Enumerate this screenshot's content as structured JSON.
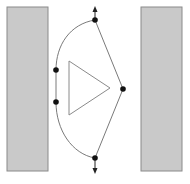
{
  "diagram": {
    "width": 190,
    "height": 184,
    "colors": {
      "background": "#ffffff",
      "wall_fill": "#c9c9c9",
      "wall_stroke": "#8a8a8a",
      "path_stroke": "#7a7a7a",
      "node_fill": "#111111",
      "triangle_stroke": "#8a8a8a"
    },
    "walls": [
      {
        "id": "left-wall",
        "x": 7,
        "y": 7,
        "w": 41,
        "h": 164
      },
      {
        "id": "right-wall",
        "x": 141,
        "y": 7,
        "w": 41,
        "h": 164
      }
    ],
    "nodes": [
      {
        "id": "top",
        "x": 95,
        "y": 20
      },
      {
        "id": "left-upper",
        "x": 56,
        "y": 70
      },
      {
        "id": "left-lower",
        "x": 56,
        "y": 102
      },
      {
        "id": "bottom",
        "x": 95,
        "y": 158
      },
      {
        "id": "right",
        "x": 123,
        "y": 89
      }
    ],
    "triangle": {
      "points": "69,61 110,88 69,115"
    },
    "arrows": [
      {
        "id": "up-arrow",
        "from": [
          95,
          20
        ],
        "to": [
          95,
          8
        ]
      },
      {
        "id": "down-arrow",
        "from": [
          95,
          158
        ],
        "to": [
          95,
          172
        ]
      }
    ]
  }
}
